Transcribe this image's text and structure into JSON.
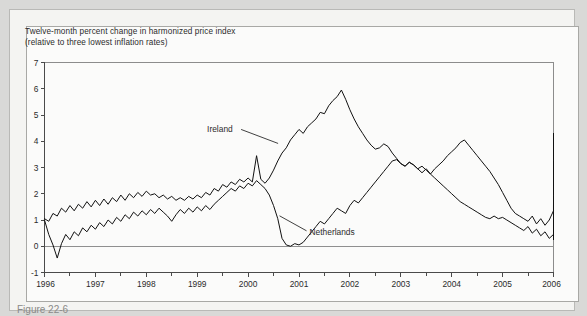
{
  "figure": {
    "title_line1": "Twelve-month percent change in harmonized price index",
    "title_line2": "(relative to three lowest inflation rates)",
    "caption": "Figure 22-6"
  },
  "colors": {
    "page_background": "#d9d9d7",
    "card_background": "#f4f4f2",
    "plot_background": "#fbfbfa",
    "line": "#111111",
    "axis": "#4a4a4a",
    "frame": "#8c8c8c",
    "zero_line": "#8f8f8f",
    "text": "#2b2b2b"
  },
  "chart_data": {
    "type": "line",
    "title": "Twelve-month percent change in harmonized price index (relative to three lowest inflation rates)",
    "subtitle": "(relative to three lowest inflation rates)",
    "xlabel": "",
    "ylabel": "",
    "xlim": [
      1996.0,
      2006.0
    ],
    "ylim": [
      -1,
      7
    ],
    "yticks": [
      -1,
      0,
      1,
      2,
      3,
      4,
      5,
      6,
      7
    ],
    "ytick_labels": [
      "-1",
      "0",
      "1",
      "2",
      "3",
      "4",
      "5",
      "6",
      "7"
    ],
    "xticks": [
      1996,
      1997,
      1998,
      1999,
      2000,
      2001,
      2002,
      2003,
      2004,
      2005,
      2006
    ],
    "xtick_labels": [
      "1996",
      "1997",
      "1998",
      "1999",
      "2000",
      "2001",
      "2002",
      "2003",
      "2004",
      "2005",
      "2006"
    ],
    "x_minor_tick_interval": 0.5,
    "grid": false,
    "zero_reference_line": 0,
    "legend_position": "inline-annotations",
    "x_start": 1996.0,
    "x_step": 0.08333,
    "series": [
      {
        "name": "Ireland",
        "label_x": 2000.0,
        "label_y": 4.45,
        "values": [
          1.05,
          0.95,
          1.25,
          1.15,
          1.45,
          1.3,
          1.55,
          1.35,
          1.6,
          1.45,
          1.7,
          1.5,
          1.75,
          1.55,
          1.8,
          1.6,
          1.85,
          1.7,
          1.95,
          1.75,
          2.0,
          1.85,
          2.05,
          1.9,
          2.1,
          1.95,
          2.0,
          1.85,
          1.95,
          1.8,
          1.9,
          1.75,
          1.85,
          1.75,
          1.9,
          1.8,
          1.95,
          1.85,
          2.05,
          1.95,
          2.2,
          2.1,
          2.35,
          2.25,
          2.45,
          2.35,
          2.55,
          2.45,
          2.6,
          2.45,
          3.45,
          2.55,
          2.4,
          2.6,
          2.9,
          3.25,
          3.55,
          3.75,
          4.05,
          4.25,
          4.45,
          4.3,
          4.55,
          4.7,
          4.85,
          5.1,
          5.05,
          5.35,
          5.55,
          5.7,
          5.95,
          5.6,
          5.2,
          4.85,
          4.55,
          4.3,
          4.05,
          3.85,
          3.7,
          3.75,
          3.9,
          3.8,
          3.55,
          3.35,
          3.15,
          3.05,
          3.2,
          3.1,
          2.95,
          3.05,
          2.9,
          2.75,
          2.95,
          3.1,
          3.25,
          3.45,
          3.6,
          3.75,
          3.95,
          4.05,
          3.85,
          3.65,
          3.45,
          3.25,
          3.05,
          2.85,
          2.6,
          2.35,
          2.05,
          1.75,
          1.45,
          1.25,
          1.15,
          1.05,
          0.95,
          1.15,
          0.85,
          1.05,
          0.8,
          1.0,
          1.35,
          1.7,
          1.95,
          2.15,
          2.3,
          2.25,
          2.4,
          2.3,
          2.2,
          2.35,
          2.25,
          2.15,
          2.3,
          2.45,
          2.35,
          2.55,
          2.7,
          2.55,
          2.45,
          2.7,
          2.95,
          3.05,
          2.85,
          3.0,
          3.25,
          3.45,
          3.35,
          3.55,
          3.75,
          3.6,
          3.45,
          3.7,
          3.95,
          4.1,
          3.9,
          4.3
        ]
      },
      {
        "name": "Netherlands",
        "label_x": 2001.05,
        "label_y": 0.55,
        "values": [
          1.0,
          0.45,
          0.05,
          -0.45,
          0.1,
          0.45,
          0.25,
          0.55,
          0.4,
          0.7,
          0.55,
          0.8,
          0.65,
          0.9,
          0.75,
          1.0,
          0.85,
          1.1,
          0.95,
          1.2,
          1.05,
          1.3,
          1.15,
          1.35,
          1.2,
          1.4,
          1.25,
          1.45,
          1.3,
          1.15,
          0.95,
          1.2,
          1.4,
          1.25,
          1.45,
          1.3,
          1.5,
          1.35,
          1.55,
          1.4,
          1.6,
          1.75,
          1.9,
          2.05,
          2.2,
          2.1,
          2.3,
          2.2,
          2.4,
          2.3,
          2.5,
          2.35,
          2.2,
          1.95,
          1.55,
          1.05,
          0.3,
          0.05,
          0.0,
          0.1,
          0.05,
          0.15,
          0.35,
          0.55,
          0.75,
          0.95,
          0.85,
          1.05,
          1.25,
          1.45,
          1.35,
          1.25,
          1.55,
          1.75,
          1.65,
          1.85,
          2.05,
          2.25,
          2.45,
          2.65,
          2.85,
          3.05,
          3.25,
          3.3,
          3.15,
          3.05,
          3.2,
          3.1,
          2.95,
          2.8,
          2.95,
          2.75,
          2.6,
          2.45,
          2.3,
          2.15,
          2.0,
          1.85,
          1.7,
          1.6,
          1.5,
          1.4,
          1.3,
          1.2,
          1.1,
          1.05,
          1.15,
          1.05,
          1.1,
          1.0,
          0.9,
          0.8,
          0.7,
          0.6,
          0.75,
          0.5,
          0.65,
          0.4,
          0.55,
          0.3,
          0.45,
          0.25,
          0.4,
          0.55,
          0.7,
          0.6,
          0.8,
          1.0,
          1.15,
          1.05,
          1.25,
          1.15,
          1.35,
          1.5,
          1.4,
          1.6,
          1.5,
          1.65,
          1.55,
          1.7,
          1.6,
          1.75,
          1.65,
          1.8,
          0.95,
          0.55,
          0.35,
          0.5,
          0.7,
          0.6,
          0.45,
          0.55,
          0.35,
          0.25,
          0.4,
          0.3
        ]
      }
    ]
  }
}
